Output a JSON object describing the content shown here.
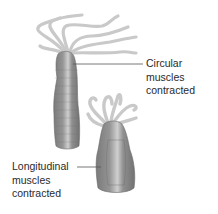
{
  "diagram": {
    "figures": [
      {
        "id": "elongated-hydra",
        "state": "elongated",
        "label_lines": [
          "Circular",
          "muscles",
          "contracted"
        ]
      },
      {
        "id": "contracted-hydra",
        "state": "shortened",
        "label_lines": [
          "Longitudinal",
          "muscles",
          "contracted"
        ]
      }
    ],
    "colors": {
      "body": "#8a8a8a",
      "body_dark": "#6e6e6e",
      "body_light": "#c4c4c4",
      "tentacle": "#c8c8c8",
      "leader_line": "#555555",
      "text": "#2a2a2a",
      "background": "#ffffff"
    }
  }
}
